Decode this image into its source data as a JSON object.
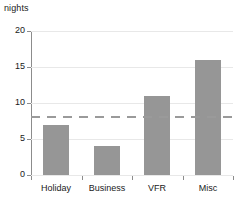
{
  "chart_data": {
    "type": "bar",
    "title": "",
    "subtitle": "",
    "xlabel": "",
    "ylabel": "nights",
    "categories": [
      "Holiday",
      "Business",
      "VFR",
      "Misc"
    ],
    "values": [
      7,
      4,
      11,
      16
    ],
    "series": [
      {
        "name": "nights",
        "values": [
          7,
          4,
          11,
          16
        ]
      }
    ],
    "ylim": [
      0,
      20
    ],
    "yticks": [
      0,
      5,
      10,
      15,
      20
    ],
    "ytick_labels": [
      "0",
      "5",
      "10",
      "15",
      "20"
    ],
    "grid": true,
    "grid_axis": "y",
    "legend": false,
    "legend_position": "none",
    "annotations": [
      {
        "name": "mean-reference-line",
        "type": "hline",
        "value": 8,
        "style": "dashed",
        "label": ""
      }
    ],
    "colors": {
      "bar_fill": "#969696",
      "grid": "#e8e8e8",
      "axis": "#8c8c8c",
      "reference_line": "#9a9a9a",
      "text": "#1a1a1a",
      "background": "#ffffff"
    }
  }
}
